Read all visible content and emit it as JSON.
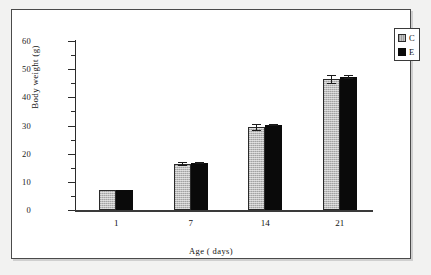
{
  "chart_data": {
    "type": "bar",
    "title": "",
    "xlabel": "Age ( days)",
    "ylabel": "Body weight (g)",
    "categories": [
      "1",
      "7",
      "14",
      "21"
    ],
    "ylim": [
      0,
      60
    ],
    "yticks": [
      0,
      10,
      20,
      30,
      40,
      50,
      60
    ],
    "ytick_labels": [
      "0",
      "10",
      "20",
      "30",
      "40",
      "50",
      "60"
    ],
    "yminor_interval": 5,
    "grid": false,
    "legend_position": "top-right",
    "series": [
      {
        "name": "C",
        "color": "#bdbdbd",
        "values": [
          7.2,
          16.2,
          29.4,
          46.4
        ],
        "errors": [
          0.0,
          0.7,
          1.2,
          1.5
        ]
      },
      {
        "name": "E",
        "color": "#0a0a0a",
        "values": [
          7.2,
          16.6,
          30.2,
          47.2
        ],
        "errors": [
          0.0,
          0.4,
          0.4,
          0.6
        ]
      }
    ]
  },
  "legend": {
    "items": [
      {
        "label": "C",
        "swatch": "light-gray"
      },
      {
        "label": "E",
        "swatch": "black"
      }
    ]
  },
  "axes": {
    "y_title": "Body weight (g)",
    "x_title": "Age ( days)",
    "y_tick_labels": [
      "60",
      "50",
      "40",
      "30",
      "20",
      "10",
      "0"
    ],
    "x_tick_labels": [
      "1",
      "7",
      "14",
      "21"
    ]
  }
}
